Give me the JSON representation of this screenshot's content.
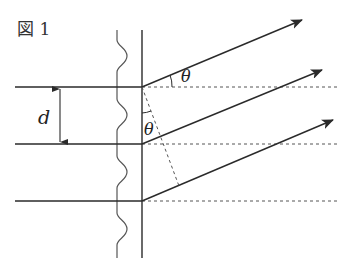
{
  "figure": {
    "title": "図 1",
    "labels": {
      "spacing": "d",
      "angle_top": "θ",
      "angle_inner": "θ"
    },
    "colors": {
      "line": "#2a2a2a",
      "dashed": "#555555",
      "background": "#ffffff"
    },
    "elements": {
      "incident_lines": 3,
      "diffracted_rays": 3,
      "reference_dashed_lines": 3
    }
  }
}
